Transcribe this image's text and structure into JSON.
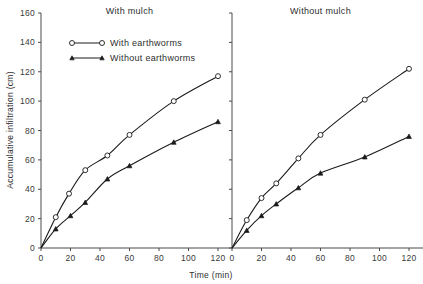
{
  "chart_data": {
    "type": "line",
    "title": "",
    "xlabel": "Time (min)",
    "ylabel": "Accumulative infiltration (cm)",
    "xlim": [
      0,
      130
    ],
    "ylim": [
      0,
      160
    ],
    "xticks": [
      0,
      20,
      40,
      60,
      80,
      100,
      120
    ],
    "yticks": [
      0,
      20,
      40,
      60,
      80,
      100,
      120,
      140,
      160
    ],
    "grid": false,
    "legend_position": "upper-left-inside-panel-1",
    "legend": [
      "With earthworms",
      "Without earthworms"
    ],
    "panels": [
      {
        "title": "With mulch",
        "series": [
          {
            "name": "With earthworms",
            "marker": "open-circle",
            "x": [
              0,
              10,
              19,
              30,
              45,
              60,
              90,
              120
            ],
            "values": [
              0,
              21,
              37,
              53,
              63,
              77,
              100,
              117
            ]
          },
          {
            "name": "Without earthworms",
            "marker": "filled-triangle",
            "x": [
              0,
              10,
              20,
              30,
              45,
              60,
              90,
              120
            ],
            "values": [
              0,
              13,
              22,
              31,
              47,
              56,
              72,
              86
            ]
          }
        ]
      },
      {
        "title": "Without mulch",
        "series": [
          {
            "name": "With earthworms",
            "marker": "open-circle",
            "x": [
              0,
              10,
              20,
              30,
              45,
              60,
              90,
              120
            ],
            "values": [
              0,
              19,
              34,
              44,
              61,
              77,
              101,
              122
            ]
          },
          {
            "name": "Without earthworms",
            "marker": "filled-triangle",
            "x": [
              0,
              10,
              20,
              30,
              45,
              60,
              90,
              120
            ],
            "values": [
              0,
              12,
              22,
              30,
              41,
              51,
              62,
              76
            ]
          }
        ]
      }
    ],
    "colors": {
      "line": "#1a1a1a",
      "axis": "#4a4a4a",
      "text": "#2e2e2e",
      "background": "#ffffff"
    }
  }
}
